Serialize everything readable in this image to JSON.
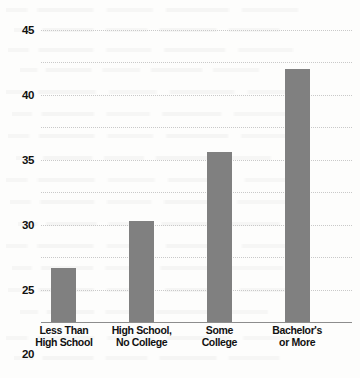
{
  "chart_data": {
    "type": "bar",
    "title": "",
    "subtitle": "",
    "xlabel": "",
    "ylabel": "",
    "categories": [
      "Less Than\nHigh School",
      "High School,\nNo College",
      "Some\nCollege",
      "Bachelor's\nor More"
    ],
    "category_lines": [
      [
        "Less Than",
        "High School"
      ],
      [
        "High School,",
        "No College"
      ],
      [
        "Some",
        "College"
      ],
      [
        "Bachelor's",
        "or More"
      ]
    ],
    "values": [
      8.3,
      15.6,
      26.2,
      39.0
    ],
    "ylim": [
      0,
      45
    ],
    "ytick_labels": [
      "0",
      "5",
      "10",
      "15",
      "20",
      "25",
      "30",
      "35",
      "40",
      "45"
    ],
    "ytick_values": [
      0,
      5,
      10,
      15,
      20,
      25,
      30,
      35,
      40,
      45
    ],
    "grid": true,
    "grid_axis": "y",
    "legend": false,
    "legend_position": "none",
    "series": [
      {
        "name": "",
        "values": [
          8.3,
          15.6,
          26.2,
          39.0
        ]
      }
    ]
  },
  "style": {
    "bar_color": "#808080",
    "gridline_color": "#c9c9c9",
    "axis_color": "#8d8d8d",
    "background_color": "#fdfdfc",
    "label_color": "#111111"
  }
}
